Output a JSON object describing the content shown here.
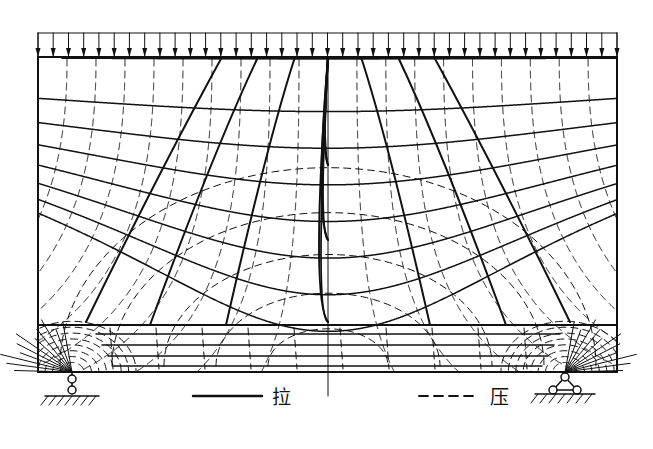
{
  "figure": {
    "type": "principal-stress-trajectory-diagram",
    "structure": "simply supported deep beam under uniform distributed load",
    "canvas": {
      "width": 653,
      "height": 449,
      "background": "#ffffff"
    },
    "line_color": "#111111"
  },
  "beam": {
    "left": 38,
    "right": 617,
    "top": 57,
    "bottom": 372,
    "outline_stroke_width": 2.0
  },
  "load": {
    "name": "uniform-distributed-load",
    "rail_y": 33,
    "arrow_count": 39,
    "arrow_tip_y": 57,
    "arrow_head_length": 9,
    "arrow_head_width": 5,
    "stroke_width": 1.0
  },
  "bottom_zone": {
    "name": "bottom-tension-chord",
    "divider_y": 325,
    "horizontal_lines_y": [
      334,
      345,
      356,
      366
    ],
    "inset_left": 96,
    "inset_right": 560
  },
  "supports": {
    "left": {
      "name": "roller-link-support",
      "x": 72,
      "beam_y": 372,
      "circle_upper_cy": 379,
      "circle_lower_cy": 390,
      "circle_r": 4.0,
      "ground_y": 396,
      "ground_half_width": 27,
      "hatch_count": 7
    },
    "right": {
      "name": "pinned-triangle-support",
      "x": 565,
      "beam_y": 372,
      "apex_cy": 377,
      "base_cy": 390,
      "base_half_width": 12,
      "circle_r": 4.0,
      "ground_y": 394,
      "ground_half_width": 30,
      "hatch_count": 7
    }
  },
  "centerline": {
    "name": "axis-of-symmetry",
    "x": 328,
    "top": 57,
    "bottom": 396
  },
  "legend": {
    "tension": {
      "label": "拉",
      "style": "solid",
      "line_x1": 193,
      "line_x2": 262,
      "line_y": 396,
      "label_x": 272,
      "label_y": 404
    },
    "compression": {
      "label": "压",
      "style": "dashed",
      "line_x1": 419,
      "line_x2": 478,
      "line_y": 396,
      "label_x": 490,
      "label_y": 404,
      "dash_pattern": "9 6"
    }
  },
  "chart_data": {
    "type": "line",
    "title": "",
    "legend_entries": [
      "拉",
      "压"
    ],
    "series": [
      {
        "name": "拉",
        "style": "solid",
        "meaning": "tension trajectory"
      },
      {
        "name": "压",
        "style": "dashed",
        "meaning": "compression trajectory"
      }
    ]
  }
}
